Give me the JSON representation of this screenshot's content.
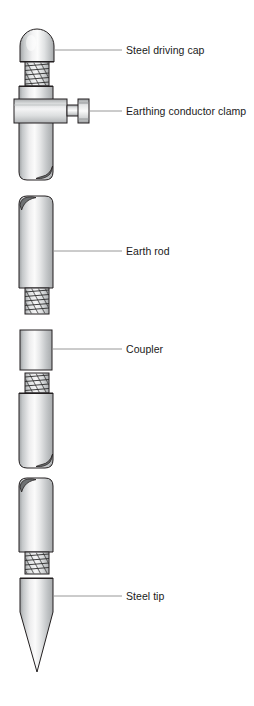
{
  "diagram": {
    "background_color": "#ffffff",
    "line_color": "#231f20",
    "leader_color": "#8c8c8c",
    "metal_light": "#fdfdfd",
    "metal_mid": "#c9cbcc",
    "metal_dark": "#8a8d8f",
    "chamfer_dark": "#6e7173",
    "labels": [
      {
        "id": "steel-driving-cap",
        "text": "Steel driving cap",
        "leader_from_x": 55,
        "leader_to_x": 122,
        "leader_y": 50
      },
      {
        "id": "earthing-conductor-clamp",
        "text": "Earthing conductor clamp",
        "leader_from_x": 90,
        "leader_to_x": 122,
        "leader_y": 111
      },
      {
        "id": "earth-rod",
        "text": "Earth rod",
        "leader_from_x": 53,
        "leader_to_x": 122,
        "leader_y": 251
      },
      {
        "id": "coupler",
        "text": "Coupler",
        "leader_from_x": 52,
        "leader_to_x": 122,
        "leader_y": 349
      },
      {
        "id": "steel-tip",
        "text": "Steel tip",
        "leader_from_x": 53,
        "leader_to_x": 122,
        "leader_y": 596
      }
    ],
    "components": [
      {
        "name": "steel-driving-cap",
        "type": "dome-cap",
        "x": 20,
        "y": 30,
        "width": 34,
        "height": 32
      },
      {
        "name": "cap-thread",
        "type": "thread",
        "x": 25,
        "y": 60,
        "width": 24,
        "height": 26
      },
      {
        "name": "upper-rod",
        "type": "rod",
        "x": 19,
        "y": 84,
        "width": 34,
        "height": 96
      },
      {
        "name": "earthing-conductor-clamp",
        "type": "clamp",
        "x": 14,
        "y": 99,
        "width": 53,
        "height": 24
      },
      {
        "name": "clamp-bolt",
        "type": "bolt",
        "x": 67,
        "y": 102,
        "width": 23,
        "height": 18
      },
      {
        "name": "earth-rod-upper",
        "type": "rod",
        "x": 19,
        "y": 196,
        "width": 34,
        "height": 92
      },
      {
        "name": "earth-rod-upper-thread",
        "type": "thread",
        "x": 25,
        "y": 288,
        "width": 24,
        "height": 26
      },
      {
        "name": "coupler",
        "type": "sleeve",
        "x": 20,
        "y": 330,
        "width": 32,
        "height": 40
      },
      {
        "name": "earth-rod-middle-thread",
        "type": "thread",
        "x": 25,
        "y": 373,
        "width": 24,
        "height": 20
      },
      {
        "name": "earth-rod-middle",
        "type": "rod",
        "x": 19,
        "y": 391,
        "width": 34,
        "height": 77
      },
      {
        "name": "earth-rod-lower",
        "type": "rod",
        "x": 19,
        "y": 478,
        "width": 34,
        "height": 74
      },
      {
        "name": "earth-rod-lower-thread",
        "type": "thread",
        "x": 25,
        "y": 552,
        "width": 24,
        "height": 22
      },
      {
        "name": "steel-tip",
        "type": "pointed-tip",
        "x": 20,
        "y": 578,
        "width": 33,
        "height": 94
      }
    ]
  }
}
